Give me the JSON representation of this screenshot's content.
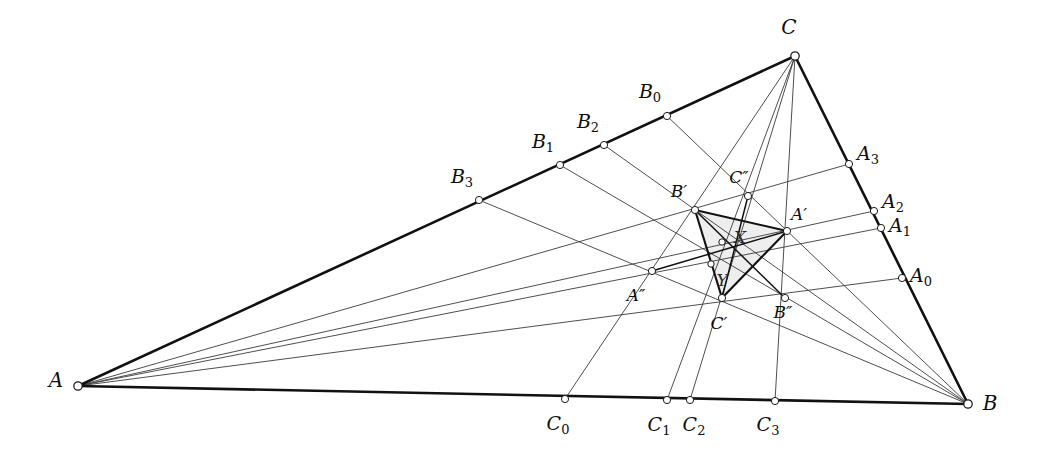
{
  "figure": {
    "background_color": "#ffffff",
    "line_color": "#3a3a3a",
    "main_edge_color": "#111111",
    "inner_fill_color": "#ebebeb",
    "node_fill_color": "#ffffff"
  },
  "vertices": [
    {
      "id": "A",
      "label": "A",
      "sub": "",
      "x": 78,
      "y": 386,
      "lx": 56,
      "ly": 381
    },
    {
      "id": "B",
      "label": "B",
      "sub": "",
      "x": 968,
      "y": 404,
      "lx": 990,
      "ly": 404
    },
    {
      "id": "C",
      "label": "C",
      "sub": "",
      "x": 795,
      "y": 56,
      "lx": 789,
      "ly": 28
    }
  ],
  "side_points_a": [
    {
      "id": "A0",
      "label": "A",
      "sub": "0",
      "x": 902,
      "y": 278,
      "lx": 921,
      "ly": 277
    },
    {
      "id": "A1",
      "label": "A",
      "sub": "1",
      "x": 881,
      "y": 228,
      "lx": 900,
      "ly": 227
    },
    {
      "id": "A2",
      "label": "A",
      "sub": "2",
      "x": 874,
      "y": 211,
      "lx": 893,
      "ly": 203
    },
    {
      "id": "A3",
      "label": "A",
      "sub": "3",
      "x": 849,
      "y": 164,
      "lx": 868,
      "ly": 155
    }
  ],
  "side_points_b": [
    {
      "id": "B0",
      "label": "B",
      "sub": "0",
      "x": 667,
      "y": 116,
      "lx": 650,
      "ly": 93
    },
    {
      "id": "B1",
      "label": "B",
      "sub": "1",
      "x": 560,
      "y": 165,
      "lx": 543,
      "ly": 143
    },
    {
      "id": "B2",
      "label": "B",
      "sub": "2",
      "x": 604,
      "y": 145,
      "lx": 588,
      "ly": 123
    },
    {
      "id": "B3",
      "label": "B",
      "sub": "3",
      "x": 479,
      "y": 200,
      "lx": 462,
      "ly": 178
    }
  ],
  "side_points_c": [
    {
      "id": "C0",
      "label": "C",
      "sub": "0",
      "x": 565,
      "y": 399,
      "lx": 558,
      "ly": 425
    },
    {
      "id": "C1",
      "label": "C",
      "sub": "1",
      "x": 667,
      "y": 400,
      "lx": 659,
      "ly": 426
    },
    {
      "id": "C2",
      "label": "C",
      "sub": "2",
      "x": 690,
      "y": 400,
      "lx": 694,
      "ly": 426
    },
    {
      "id": "C3",
      "label": "C",
      "sub": "3",
      "x": 775,
      "y": 401,
      "lx": 768,
      "ly": 426
    }
  ],
  "inner_points": [
    {
      "id": "Aprime",
      "label": "A′",
      "x": 787,
      "y": 231,
      "lx": 799,
      "ly": 215
    },
    {
      "id": "Bprime",
      "label": "B′",
      "x": 695,
      "y": 210,
      "lx": 679,
      "ly": 192
    },
    {
      "id": "Cprime",
      "label": "C′",
      "x": 722,
      "y": 298,
      "lx": 719,
      "ly": 324
    },
    {
      "id": "Adprime",
      "label": "A″",
      "x": 652,
      "y": 271,
      "lx": 636,
      "ly": 296
    },
    {
      "id": "Bdprime",
      "label": "B″",
      "x": 785,
      "y": 298,
      "lx": 783,
      "ly": 313
    },
    {
      "id": "Cdprime",
      "label": "C″",
      "x": 748,
      "y": 196,
      "lx": 739,
      "ly": 178
    }
  ],
  "marked_points": [
    {
      "id": "X",
      "label": "X",
      "x": 722,
      "y": 242,
      "lx": 740,
      "ly": 238
    },
    {
      "id": "Y",
      "label": "Y",
      "x": 711,
      "y": 264,
      "lx": 722,
      "ly": 281
    }
  ]
}
